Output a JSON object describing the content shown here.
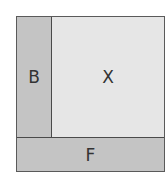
{
  "diagram": {
    "regions": [
      {
        "id": "B",
        "label": "B",
        "color": "#c4c4c4"
      },
      {
        "id": "X",
        "label": "X",
        "color": "#e6e6e6"
      },
      {
        "id": "F",
        "label": "F",
        "color": "#c4c4c4"
      }
    ],
    "border_color": "#4a4a4a"
  }
}
